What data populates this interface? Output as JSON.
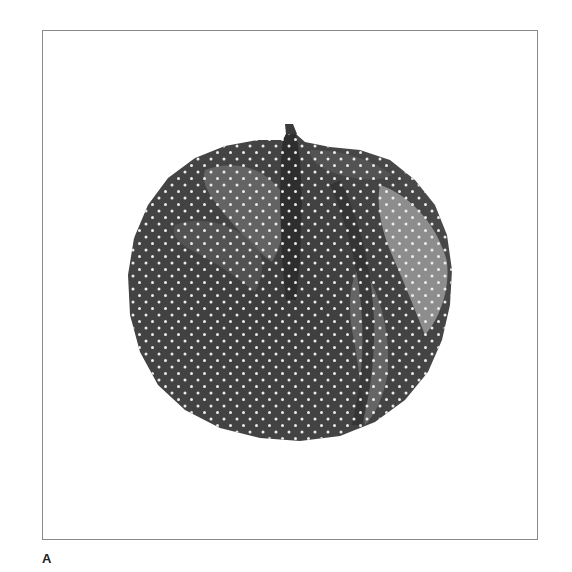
{
  "figure": {
    "panel_label": "A",
    "colors": {
      "frame_border": "#8a8a8a",
      "background": "#ffffff",
      "fruit_dark": "#3f3f3f",
      "fruit_mid": "#5e5e5e",
      "fruit_light": "#9a9a9a",
      "halftone_dot": "#e8e8e8",
      "label": "#222222"
    }
  }
}
